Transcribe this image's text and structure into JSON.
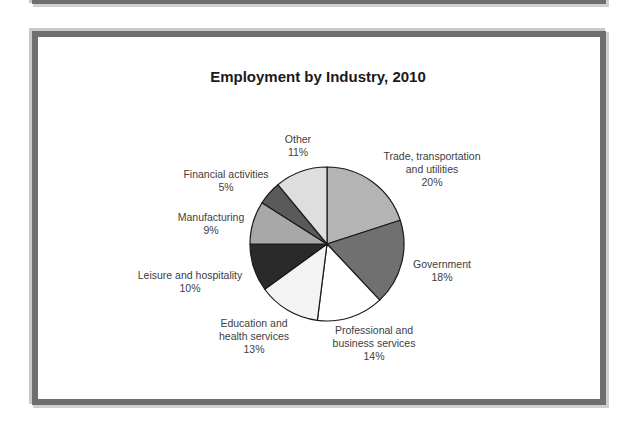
{
  "chart_data": {
    "type": "pie",
    "title": "Employment by Industry, 2010",
    "unit": "%",
    "start": "12 o'clock, clockwise",
    "slices": [
      {
        "label_lines": [
          "Trade, transportation",
          "and utilities"
        ],
        "label": "Trade, transportation and utilities",
        "value": 20,
        "value_label": "20%",
        "color": "#b4b4b4"
      },
      {
        "label_lines": [
          "Government"
        ],
        "label": "Government",
        "value": 18,
        "value_label": "18%",
        "color": "#707070"
      },
      {
        "label_lines": [
          "Professional and",
          "business services"
        ],
        "label": "Professional and business services",
        "value": 14,
        "value_label": "14%",
        "color": "#ffffff"
      },
      {
        "label_lines": [
          "Education and",
          "health services"
        ],
        "label": "Education and health services",
        "value": 13,
        "value_label": "13%",
        "color": "#f3f3f3"
      },
      {
        "label_lines": [
          "Leisure and hospitality"
        ],
        "label": "Leisure and hospitality",
        "value": 10,
        "value_label": "10%",
        "color": "#2a2a2a"
      },
      {
        "label_lines": [
          "Manufacturing"
        ],
        "label": "Manufacturing",
        "value": 9,
        "value_label": "9%",
        "color": "#a8a8a8"
      },
      {
        "label_lines": [
          "Financial activities"
        ],
        "label": "Financial activities",
        "value": 5,
        "value_label": "5%",
        "color": "#5a5a5a"
      },
      {
        "label_lines": [
          "Other"
        ],
        "label": "Other",
        "value": 11,
        "value_label": "11%",
        "color": "#dedede"
      }
    ],
    "legend": "none (labels placed outside slices)"
  },
  "colors": {
    "frame_border": "#6f6f6f",
    "slice_outline": "#1a1a1a",
    "title_text": "#1a1a1a",
    "label_text": "#404040"
  }
}
